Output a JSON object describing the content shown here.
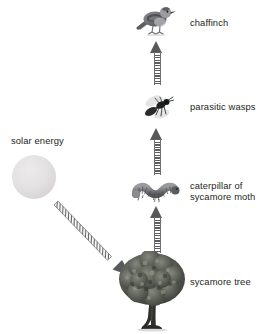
{
  "diagram": {
    "background_color": "#ffffff",
    "text_color": "#231f20",
    "arrow_color": "#58595b",
    "sun_color": "#e3e1e1"
  },
  "energy_source": {
    "label": "solar energy",
    "icon": "sun-circle-icon"
  },
  "trophic_levels": [
    {
      "rank": 1,
      "label": "sycamore tree",
      "icon": "tree-icon",
      "role": "producer"
    },
    {
      "rank": 2,
      "label": "caterpillar of\nsycamore moth",
      "icon": "caterpillar-icon",
      "role": "primary consumer"
    },
    {
      "rank": 3,
      "label": "parasitic wasps",
      "icon": "wasp-icon",
      "role": "secondary consumer"
    },
    {
      "rank": 4,
      "label": "chaffinch",
      "icon": "bird-icon",
      "role": "tertiary consumer"
    }
  ],
  "arrows": [
    {
      "name": "solar-to-tree",
      "direction": "diagonal-down-right",
      "style": "striped"
    },
    {
      "name": "tree-to-caterpillar",
      "direction": "up",
      "style": "striped"
    },
    {
      "name": "caterpillar-to-wasps",
      "direction": "up",
      "style": "striped"
    },
    {
      "name": "wasps-to-chaffinch",
      "direction": "up",
      "style": "striped"
    }
  ]
}
